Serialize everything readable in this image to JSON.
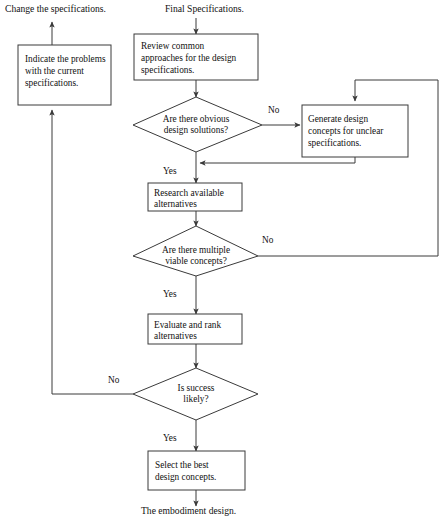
{
  "diagram": {
    "colors": {
      "stroke": "#3a3a3a",
      "text": "#111111",
      "background": "#ffffff"
    },
    "free_labels": {
      "change_specs": "Change the specifications.",
      "final_specs": "Final Specifications.",
      "embodiment": "The embodiment design."
    },
    "nodes": {
      "indicate_problems": {
        "type": "process",
        "lines": [
          "Indicate the problems",
          "with the current",
          "specifications."
        ]
      },
      "review_common": {
        "type": "process",
        "lines": [
          "Review common",
          "approaches for the design",
          "specifications."
        ]
      },
      "obvious_solutions": {
        "type": "decision",
        "lines": [
          "Are there obvious",
          "design solutions?"
        ]
      },
      "generate_concepts": {
        "type": "process",
        "lines": [
          "Generate design",
          "concepts for unclear",
          "specifications."
        ]
      },
      "research_alternatives": {
        "type": "process",
        "lines": [
          "Research available",
          "alternatives"
        ]
      },
      "multiple_concepts": {
        "type": "decision",
        "lines": [
          "Are there multiple",
          "viable concepts?"
        ]
      },
      "evaluate_rank": {
        "type": "process",
        "lines": [
          "Evaluate and rank",
          "alternatives"
        ]
      },
      "is_success_likely": {
        "type": "decision",
        "lines": [
          "Is success",
          "likely?"
        ]
      },
      "select_best": {
        "type": "process",
        "lines": [
          "Select the best",
          "design concepts."
        ]
      }
    },
    "edge_labels": {
      "obvious_no": "No",
      "obvious_yes": "Yes",
      "multiple_no": "No",
      "multiple_yes": "Yes",
      "success_no": "No",
      "success_yes": "Yes"
    }
  }
}
